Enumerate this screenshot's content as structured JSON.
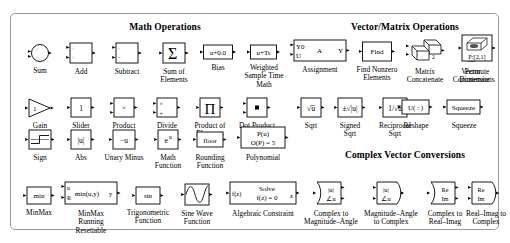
{
  "palette": {
    "window_title": "Math Operations",
    "sections": [
      {
        "id": "math_operations",
        "title": "Math Operations"
      },
      {
        "id": "vector_matrix",
        "title": "Vector/Matrix Operations"
      },
      {
        "id": "complex_vector",
        "title": "Complex Vector Conversions"
      }
    ],
    "blocks": [
      {
        "id": "sum",
        "caption": "Sum",
        "icon": "sum-circle-icon",
        "glyph": "+\n+",
        "section": "math_operations"
      },
      {
        "id": "add",
        "caption": "Add",
        "icon": "add-block-icon",
        "glyph": "+\n+",
        "section": "math_operations"
      },
      {
        "id": "subtract",
        "caption": "Subtract",
        "icon": "subtract-block-icon",
        "glyph": "+\n−",
        "section": "math_operations"
      },
      {
        "id": "sum_of_elements",
        "caption": "Sum of\nElements",
        "icon": "sigma-icon",
        "glyph": "∑",
        "section": "math_operations"
      },
      {
        "id": "bias",
        "caption": "Bias",
        "icon": "bias-block-icon",
        "glyph": "u+0.0",
        "section": "math_operations"
      },
      {
        "id": "weighted_sample",
        "caption": "Weighted\nSample Time\nMath",
        "icon": "weighted-sample-time-icon",
        "glyph": "u+Ts",
        "section": "math_operations"
      },
      {
        "id": "assignment",
        "caption": "Assignment",
        "icon": "assignment-block-icon",
        "glyph": "Y0 U A Y",
        "section": "math_operations",
        "labels": {
          "in1": "Y0",
          "in2": "U",
          "center": "A",
          "out": "Y"
        }
      },
      {
        "id": "find_nonzero",
        "caption": "Find Nonzero\nElements",
        "icon": "find-block-icon",
        "glyph": "Find",
        "section": "vector_matrix"
      },
      {
        "id": "matrix_concat",
        "caption": "Matrix\nConcatenate",
        "icon": "matrix-concatenate-icon",
        "glyph": "2",
        "section": "vector_matrix"
      },
      {
        "id": "vector_concat",
        "caption": "Vector\nConcatenate",
        "icon": "vector-concatenate-icon",
        "glyph": "",
        "section": "vector_matrix"
      },
      {
        "id": "permute_dims",
        "caption": "Permute\nDimensions",
        "icon": "permute-dimensions-icon",
        "glyph": "P:[2,1]",
        "section": "vector_matrix"
      },
      {
        "id": "gain",
        "caption": "Gain",
        "icon": "gain-triangle-icon",
        "glyph": "1",
        "section": "math_operations"
      },
      {
        "id": "slider_gain",
        "caption": "Slider\nGain",
        "icon": "slider-gain-icon",
        "glyph": "1",
        "section": "math_operations"
      },
      {
        "id": "product",
        "caption": "Product",
        "icon": "product-block-icon",
        "glyph": "×",
        "section": "math_operations"
      },
      {
        "id": "divide",
        "caption": "Divide",
        "icon": "divide-block-icon",
        "glyph": "×\n÷",
        "section": "math_operations"
      },
      {
        "id": "product_elements",
        "caption": "Product of\nElements",
        "icon": "product-of-elements-icon",
        "glyph": "∏",
        "section": "math_operations"
      },
      {
        "id": "dot_product",
        "caption": "Dot Product",
        "icon": "dot-product-icon",
        "glyph": "▪",
        "section": "math_operations"
      },
      {
        "id": "sqrt",
        "caption": "Sqrt",
        "icon": "sqrt-icon",
        "glyph": "√u",
        "section": "math_operations"
      },
      {
        "id": "signed_sqrt",
        "caption": "Signed\nSqrt",
        "icon": "signed-sqrt-icon",
        "glyph": "±√|u|",
        "section": "math_operations"
      },
      {
        "id": "reciprocal_sqrt",
        "caption": "Reciprocal\nSqrt",
        "icon": "reciprocal-sqrt-icon",
        "glyph": "1/√u",
        "section": "math_operations"
      },
      {
        "id": "reshape",
        "caption": "Reshape",
        "icon": "reshape-block-icon",
        "glyph": "U( : )",
        "section": "vector_matrix"
      },
      {
        "id": "squeeze",
        "caption": "Squeeze",
        "icon": "squeeze-block-icon",
        "glyph": "Squeeze",
        "section": "vector_matrix"
      },
      {
        "id": "sign",
        "caption": "Sign",
        "icon": "sign-block-icon",
        "glyph": "",
        "section": "math_operations"
      },
      {
        "id": "abs",
        "caption": "Abs",
        "icon": "abs-block-icon",
        "glyph": "|u|",
        "section": "math_operations"
      },
      {
        "id": "unary_minus",
        "caption": "Unary Minus",
        "icon": "unary-minus-icon",
        "glyph": "−u",
        "section": "math_operations"
      },
      {
        "id": "math_function",
        "caption": "Math\nFunction",
        "icon": "math-function-icon",
        "glyph": "eᵘ",
        "section": "math_operations"
      },
      {
        "id": "rounding",
        "caption": "Rounding\nFunction",
        "icon": "rounding-function-icon",
        "glyph": "floor",
        "section": "math_operations"
      },
      {
        "id": "polynomial",
        "caption": "Polynomial",
        "icon": "polynomial-block-icon",
        "glyph": "P(u)\nO(P) = 5",
        "section": "math_operations",
        "labels": {
          "line1": "P(u)",
          "line2": "O(P) = 5"
        }
      },
      {
        "id": "minmax",
        "caption": "MinMax",
        "icon": "minmax-block-icon",
        "glyph": "min",
        "section": "math_operations"
      },
      {
        "id": "minmax_running",
        "caption": "MinMax\nRunning\nResettable",
        "icon": "minmax-running-icon",
        "glyph": "min(u,y)",
        "section": "math_operations",
        "labels": {
          "in1": "u",
          "in2": "R",
          "body": "min(u,y)",
          "out": "y"
        }
      },
      {
        "id": "trig_function",
        "caption": "Trigonometric\nFunction",
        "icon": "trigonometric-function-icon",
        "glyph": "sin",
        "section": "math_operations"
      },
      {
        "id": "sine_wave",
        "caption": "Sine Wave\nFunction",
        "icon": "sine-wave-icon",
        "glyph": "",
        "section": "math_operations"
      },
      {
        "id": "algebraic",
        "caption": "Algebraic Constraint",
        "icon": "algebraic-constraint-icon",
        "glyph": "Solve f(z) = 0",
        "section": "math_operations",
        "labels": {
          "in": "f(z)",
          "line1": "Solve",
          "line2": "f(z) = 0",
          "out": "z"
        }
      },
      {
        "id": "complex_to_mag",
        "caption": "Complex to\nMagnitude–Angle",
        "icon": "complex-to-magnitude-angle-icon",
        "glyph": "|u| ∠u",
        "section": "complex_vector",
        "labels": {
          "out1": "|u|",
          "out2": "∠u"
        }
      },
      {
        "id": "mag_to_complex",
        "caption": "Magnitude–Angle\nto Complex",
        "icon": "magnitude-angle-to-complex-icon",
        "glyph": "|u| ∠u",
        "section": "complex_vector",
        "labels": {
          "in1": "|u|",
          "in2": "∠u"
        }
      },
      {
        "id": "complex_to_reim",
        "caption": "Complex to\nReal–Imag",
        "icon": "complex-to-real-imag-icon",
        "glyph": "Re Im",
        "section": "complex_vector",
        "labels": {
          "out1": "Re",
          "out2": "Im"
        }
      },
      {
        "id": "reim_to_complex",
        "caption": "Real–Imag to\nComplex",
        "icon": "real-imag-to-complex-icon",
        "glyph": "Re Im",
        "section": "complex_vector",
        "labels": {
          "in1": "Re",
          "in2": "Im"
        }
      }
    ]
  }
}
